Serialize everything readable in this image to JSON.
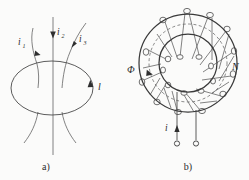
{
  "figure": {
    "background_color": "#fbfbfa",
    "ink_color": "#4a4a4a",
    "panels": [
      {
        "id": "panel-a",
        "caption": "a)",
        "title_note": "Ampere law closed loop with three currents",
        "loop_label": "l",
        "currents": [
          {
            "name": "i",
            "subscript": "1",
            "direction": "downward-into-loop"
          },
          {
            "name": "i",
            "subscript": "2",
            "direction": "downward-into-loop"
          },
          {
            "name": "i",
            "subscript": "3",
            "direction": "upward-out-of-loop"
          }
        ]
      },
      {
        "id": "panel-b",
        "caption": "b)",
        "title_note": "Toroidal coil with N turns carrying current i and flux Phi",
        "flux_label": "Φ",
        "turns_label": "N",
        "current_label": "i",
        "terminal_count": 2,
        "winding_turns_drawn": 10
      }
    ]
  }
}
